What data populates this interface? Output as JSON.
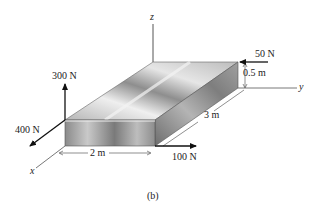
{
  "figure": {
    "caption": "(b)",
    "axes": {
      "x": "x",
      "y": "y",
      "z": "z"
    },
    "forces": [
      {
        "id": "f300",
        "label": "300 N",
        "direction": "+z"
      },
      {
        "id": "f400",
        "label": "400 N",
        "direction": "+x"
      },
      {
        "id": "f100",
        "label": "100 N",
        "direction": "+y"
      },
      {
        "id": "f50",
        "label": "50 N",
        "direction": "-y"
      }
    ],
    "dimensions": [
      {
        "id": "width",
        "label": "2 m",
        "axis": "x"
      },
      {
        "id": "length",
        "label": "3 m",
        "axis": "y"
      },
      {
        "id": "height",
        "label": "0.5 m",
        "axis": "z"
      }
    ],
    "colors": {
      "box_light": "#e8e8e8",
      "box_mid": "#a9a9a9",
      "box_dark": "#6f6f6f",
      "lines": "#222222"
    }
  }
}
